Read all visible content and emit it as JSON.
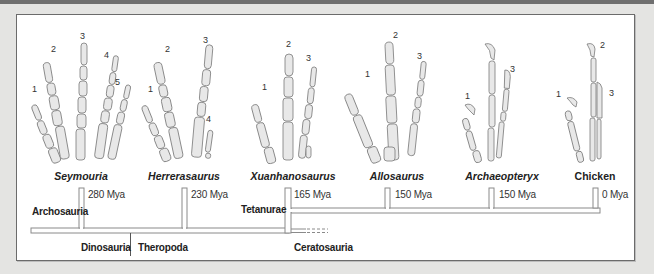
{
  "figure": {
    "type": "phylogenetic-hand-evolution",
    "colors": {
      "bone_fill": "#e6e6e6",
      "bone_stroke": "#7a7a7a",
      "frame_border": "#6b6b6b",
      "background": "#e4e4e2",
      "tree_line": "#8a8a8a"
    }
  },
  "taxa": [
    {
      "name": "Seymouria",
      "italic": true,
      "age": "280 Mya",
      "digit_labels": [
        "1",
        "2",
        "3",
        "4",
        "5"
      ]
    },
    {
      "name": "Herrerasaurus",
      "italic": true,
      "age": "230 Mya",
      "digit_labels": [
        "1",
        "2",
        "3",
        "4"
      ]
    },
    {
      "name": "Xuanhanosaurus",
      "italic": true,
      "age": "165 Mya",
      "digit_labels": [
        "1",
        "2",
        "3"
      ]
    },
    {
      "name": "Allosaurus",
      "italic": true,
      "age": "150 Mya",
      "digit_labels": [
        "1",
        "2",
        "3"
      ]
    },
    {
      "name": "Archaeopteryx",
      "italic": true,
      "age": "150 Mya",
      "digit_labels": [
        "1",
        "3"
      ]
    },
    {
      "name": "Chicken",
      "italic": false,
      "age": "0 Mya",
      "digit_labels": [
        "1",
        "2",
        "3"
      ]
    }
  ],
  "clades": {
    "archosauria": "Archosauria",
    "dinosauria": "Dinosauria",
    "theropoda": "Theropoda",
    "tetanurae": "Tetanurae",
    "ceratosauria": "Ceratosauria"
  }
}
